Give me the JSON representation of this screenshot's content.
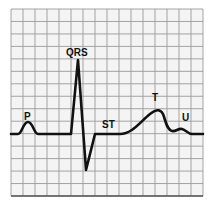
{
  "diagram": {
    "grid": {
      "left": 11,
      "top": 9,
      "right": 203,
      "bottom": 196,
      "cols": 16,
      "rows": 15,
      "line_color": "#9a9a9a",
      "bg_color": "#f4f4f4"
    },
    "trace_color": "#111111",
    "labels": {
      "p": "P",
      "qrs": "QRS",
      "st": "ST",
      "t": "T",
      "u": "U"
    }
  }
}
